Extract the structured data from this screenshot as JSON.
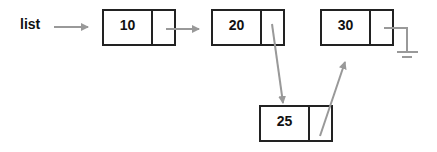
{
  "diagram": {
    "type": "linked-list-insertion",
    "head_label": "list",
    "nodes": [
      {
        "id": "n1",
        "value": "10",
        "x": 102,
        "y": 9
      },
      {
        "id": "n2",
        "value": "20",
        "x": 211,
        "y": 9
      },
      {
        "id": "n3",
        "value": "30",
        "x": 320,
        "y": 9
      },
      {
        "id": "n4",
        "value": "25",
        "x": 259,
        "y": 105
      }
    ],
    "edges": [
      {
        "from": "list",
        "to": "n1"
      },
      {
        "from": "n1",
        "to": "n2"
      },
      {
        "from": "n2",
        "to": "n4"
      },
      {
        "from": "n4",
        "to": "n3"
      },
      {
        "from": "n3",
        "to": "null"
      }
    ],
    "colors": {
      "box_border": "#222222",
      "arrow": "#999999",
      "text": "#111111"
    }
  }
}
